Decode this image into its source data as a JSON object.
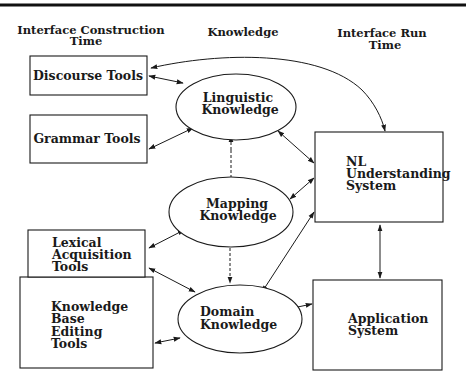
{
  "headers": {
    "construction_line1": "Interface Construction",
    "construction_line2": "Time",
    "knowledge": "Knowledge",
    "runtime_line1": "Interface Run",
    "runtime_line2": "Time"
  },
  "tools": {
    "discourse": "Discourse Tools",
    "grammar": "Grammar Tools",
    "lexical_line1": "Lexical",
    "lexical_line2": "Acquisition",
    "lexical_line3": "Tools",
    "kb_line1": "Knowledge",
    "kb_line2": "Base",
    "kb_line3": "Editing",
    "kb_line4": "Tools"
  },
  "knowledge": {
    "linguistic_line1": "Linguistic",
    "linguistic_line2": "Knowledge",
    "mapping_line1": "Mapping",
    "mapping_line2": "Knowledge",
    "domain_line1": "Domain",
    "domain_line2": "Knowledge"
  },
  "runtime": {
    "nl_line1": "NL",
    "nl_line2": "Understanding",
    "nl_line3": "System",
    "app_line1": "Application",
    "app_line2": "System"
  },
  "edges": [
    {
      "from": "Discourse Tools",
      "to": "Linguistic Knowledge",
      "type": "bidirectional"
    },
    {
      "from": "Discourse Tools",
      "to": "NL Understanding System",
      "type": "bidirectional-curved"
    },
    {
      "from": "Grammar Tools",
      "to": "Linguistic Knowledge",
      "type": "bidirectional"
    },
    {
      "from": "Mapping Knowledge",
      "to": "Linguistic Knowledge",
      "type": "dashed"
    },
    {
      "from": "Mapping Knowledge",
      "to": "Domain Knowledge",
      "type": "dashed"
    },
    {
      "from": "Lexical Acquisition Tools",
      "to": "Mapping Knowledge",
      "type": "bidirectional"
    },
    {
      "from": "Lexical Acquisition Tools",
      "to": "Domain Knowledge",
      "type": "bidirectional"
    },
    {
      "from": "Knowledge Base Editing Tools",
      "to": "Domain Knowledge",
      "type": "bidirectional"
    },
    {
      "from": "Linguistic Knowledge",
      "to": "NL Understanding System",
      "type": "bidirectional"
    },
    {
      "from": "Mapping Knowledge",
      "to": "NL Understanding System",
      "type": "bidirectional"
    },
    {
      "from": "Domain Knowledge",
      "to": "NL Understanding System",
      "type": "bidirectional"
    },
    {
      "from": "NL Understanding System",
      "to": "Application System",
      "type": "bidirectional"
    },
    {
      "from": "Domain Knowledge",
      "to": "Application System",
      "type": "bidirectional"
    }
  ]
}
